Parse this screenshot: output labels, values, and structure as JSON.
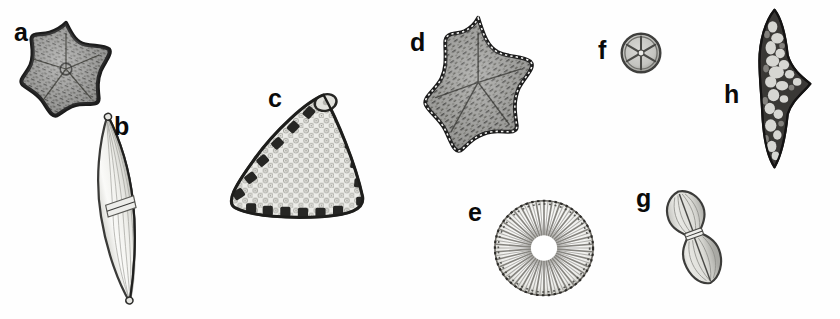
{
  "figure": {
    "kind": "scientific-plate",
    "background_color": "#fefefe",
    "label_color": "#0a0a0a",
    "width": 840,
    "height": 319
  },
  "panels": [
    {
      "id": "a",
      "label": "a",
      "shape": "five-pointed-star",
      "description": "star-shaped valve with dark granular interior and beaded margin",
      "fill": "#8e8e8e",
      "outline": "#1c1c1c"
    },
    {
      "id": "b",
      "label": "b",
      "shape": "lanceolate-spindle",
      "description": "elongate lanceolate valve with central nodule and longitudinal striae, tilted",
      "fill": "#f2f2f0",
      "outline": "#3a3a38"
    },
    {
      "id": "c",
      "label": "c",
      "shape": "rounded-triangle",
      "description": "triangular valve with areolate surface and dark marginal spines",
      "fill": "#e9e9e6",
      "outline": "#2a2a28"
    },
    {
      "id": "d",
      "label": "d",
      "shape": "five-pointed-star",
      "description": "star-shaped valve, coarser granular interior, beaded margin",
      "fill": "#909090",
      "outline": "#1a1a1a"
    },
    {
      "id": "e",
      "label": "e",
      "shape": "radial-disc",
      "description": "circular valve with dense radial striae and dotted margin",
      "fill": "#fbfbfa",
      "outline": "#55534f"
    },
    {
      "id": "f",
      "label": "f",
      "shape": "small-segmented-disc",
      "description": "small circular valve divided into radial sectors",
      "fill": "#c9c9c6",
      "outline": "#4a4a48"
    },
    {
      "id": "g",
      "label": "g",
      "shape": "panduriform-dumbbell",
      "description": "peanut-shaped valve constricted at centre with axial raphe",
      "fill": "#d6d6d2",
      "outline": "#3c3c3a"
    },
    {
      "id": "h",
      "label": "h",
      "shape": "irregular-chevron",
      "description": "dark arrow-like irregular fragment with pale mottled inclusions",
      "fill": "#3d3b39",
      "outline": "#1b1a19"
    }
  ]
}
